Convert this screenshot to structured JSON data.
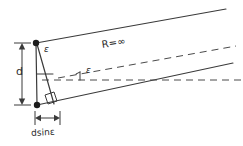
{
  "diagram": {
    "background_color": "#ffffff",
    "ink_color": "#2f2f2f",
    "labels": {
      "epsilon_top": "ε",
      "epsilon_mid": "ε",
      "radius": "R=∞",
      "baseline": "d",
      "path_difference": "dsinε"
    },
    "markers": {
      "top_vertex": "filled-dot",
      "bottom_vertex": "filled-dot",
      "right_angle": "right-angle-square"
    },
    "lines": {
      "upper_ray": "solid",
      "lower_ray": "solid",
      "wavefront_normal": "dashed",
      "optical_axis": "dashed"
    }
  }
}
